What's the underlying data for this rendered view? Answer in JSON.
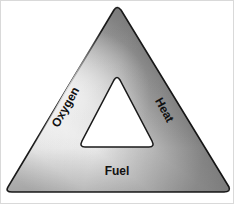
{
  "diagram": {
    "name": "fire-triangle",
    "shape": "triangle",
    "style": {
      "fill_gradient_light": "#fbfbfb",
      "fill_gradient_mid": "#c9c9c9",
      "fill_gradient_dark": "#6e6e6e",
      "outline_color": "#1a1a1a",
      "inner_fill": "#ffffff",
      "label_color": "#111111",
      "frame_color": "#d9d9d9"
    },
    "labels": [
      {
        "id": "oxygen",
        "text": "Oxygen",
        "side": "left",
        "rotation_deg": -61,
        "x": 68,
        "y": 108,
        "font_size": 12
      },
      {
        "id": "heat",
        "text": "Heat",
        "side": "right",
        "rotation_deg": 61,
        "x": 159,
        "y": 110,
        "font_size": 12
      },
      {
        "id": "fuel",
        "text": "Fuel",
        "side": "bottom",
        "rotation_deg": 0,
        "x": 116,
        "y": 174,
        "font_size": 12
      }
    ],
    "geometry": {
      "outer_apex": {
        "x": 118,
        "y": 5
      },
      "outer_left": {
        "x": 6,
        "y": 191
      },
      "outer_right": {
        "x": 228,
        "y": 191
      },
      "inner_apex": {
        "x": 116,
        "y": 76
      },
      "inner_left": {
        "x": 80,
        "y": 146
      },
      "inner_right": {
        "x": 152,
        "y": 146
      }
    }
  }
}
